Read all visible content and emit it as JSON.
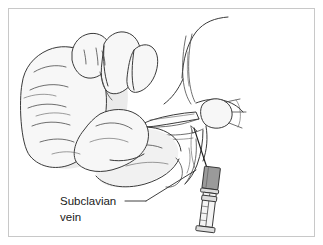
{
  "figure": {
    "domain_caption": "Medical line illustration of subclavian vein needle access",
    "width": 323,
    "height": 245,
    "background_color": "#ffffff",
    "frame": {
      "stroke_color": "#c8c8c8",
      "inset_px": 8
    }
  },
  "annotations": {
    "subclavian_label": {
      "line1": "Subclavian",
      "line2": "vein",
      "text_color": "#1a1a1a",
      "leader_color": "#2a2a2a"
    }
  },
  "anatomy": {
    "hand": {
      "name": "clinician-hand",
      "fill_color": "#f7f7f7",
      "outline_color": "#3a3a3a",
      "shade_color": "#ebebeb"
    },
    "neck": {
      "name": "neck-contour",
      "outline_color": "#3a3a3a"
    },
    "sternocleidomastoid": {
      "name": "sternocleidomastoid-muscle",
      "outline_color": "#4a4a4a"
    },
    "clavicle": {
      "name": "clavicle-bone",
      "fill_color": "#fdfdfd",
      "outline_color": "#3a3a3a"
    },
    "humeral_head": {
      "name": "humeral-head-joint",
      "outline_color": "#3a3a3a"
    },
    "shoulder": {
      "name": "shoulder-contour",
      "outline_color": "#3a3a3a"
    },
    "forearm": {
      "name": "patient-forearm",
      "fill_color": "#f7f7f7",
      "outline_color": "#3a3a3a"
    }
  },
  "instrument": {
    "syringe": {
      "name": "syringe",
      "hub_color": "#9a9a9a",
      "barrel_color": "#f4f4f4",
      "plunger_color": "#dedede",
      "outline_color": "#2e2e2e",
      "graduation_count": 4
    },
    "needle": {
      "name": "needle",
      "color": "#1c1c1c"
    }
  }
}
